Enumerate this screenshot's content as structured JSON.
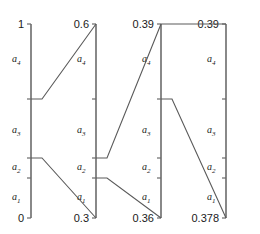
{
  "figure": {
    "type": "nomogram",
    "axis_count": 4,
    "region_labels": [
      "a_1",
      "a_2",
      "a_3",
      "a_4"
    ],
    "axes": [
      {
        "id": "axis-1",
        "x": 31,
        "top_label": "1",
        "bottom_label": "0",
        "top_label_anchor": "end",
        "bottom_label_anchor": "end",
        "top_y": 24,
        "bottom_y": 218,
        "ticks": [
          24,
          99,
          158,
          178,
          218
        ],
        "regions": [
          {
            "name": "a4",
            "glyph": "a",
            "sub": "4",
            "label_y": 62
          },
          {
            "name": "a3",
            "glyph": "a",
            "sub": "3",
            "label_y": 133
          },
          {
            "name": "a2",
            "glyph": "a",
            "sub": "2",
            "label_y": 170
          },
          {
            "name": "a1",
            "glyph": "a",
            "sub": "1",
            "label_y": 200
          }
        ]
      },
      {
        "id": "axis-2",
        "x": 96,
        "top_label": "0.6",
        "bottom_label": "0.3",
        "top_label_anchor": "end",
        "bottom_label_anchor": "end",
        "top_y": 24,
        "bottom_y": 218,
        "ticks": [
          24,
          99,
          158,
          178,
          218
        ],
        "regions": [
          {
            "name": "a4",
            "glyph": "a",
            "sub": "4",
            "label_y": 62
          },
          {
            "name": "a3",
            "glyph": "a",
            "sub": "3",
            "label_y": 133
          },
          {
            "name": "a2",
            "glyph": "a",
            "sub": "2",
            "label_y": 170
          },
          {
            "name": "a1",
            "glyph": "a",
            "sub": "1",
            "label_y": 200
          }
        ]
      },
      {
        "id": "axis-3",
        "x": 161,
        "top_label": "0.39",
        "bottom_label": "0.36",
        "top_label_anchor": "end",
        "bottom_label_anchor": "end",
        "top_y": 24,
        "bottom_y": 218,
        "ticks": [
          24,
          99,
          158,
          178,
          218
        ],
        "regions": [
          {
            "name": "a4",
            "glyph": "a",
            "sub": "4",
            "label_y": 62
          },
          {
            "name": "a3",
            "glyph": "a",
            "sub": "3",
            "label_y": 133
          },
          {
            "name": "a2",
            "glyph": "a",
            "sub": "2",
            "label_y": 170
          },
          {
            "name": "a1",
            "glyph": "a",
            "sub": "1",
            "label_y": 200
          }
        ]
      },
      {
        "id": "axis-4",
        "x": 226,
        "top_label": "0.39",
        "bottom_label": "0.378",
        "top_label_anchor": "end",
        "bottom_label_anchor": "end",
        "top_y": 24,
        "bottom_y": 218,
        "ticks": [
          24,
          99,
          158,
          178,
          218
        ],
        "regions": [
          {
            "name": "a4",
            "glyph": "a",
            "sub": "4",
            "label_y": 62
          },
          {
            "name": "a3",
            "glyph": "a",
            "sub": "3",
            "label_y": 133
          },
          {
            "name": "a2",
            "glyph": "a",
            "sub": "2",
            "label_y": 170
          },
          {
            "name": "a1",
            "glyph": "a",
            "sub": "1",
            "label_y": 200
          }
        ]
      }
    ],
    "connectors": [
      {
        "id": "conn-1",
        "from_axis": 1,
        "from_y": 99,
        "to_axis": 2,
        "to_y": 24,
        "stub": 11
      },
      {
        "id": "conn-2",
        "from_axis": 1,
        "from_y": 158,
        "to_axis": 2,
        "to_y": 218,
        "stub": 11
      },
      {
        "id": "conn-3",
        "from_axis": 2,
        "from_y": 158,
        "to_axis": 3,
        "to_y": 24,
        "stub": 11
      },
      {
        "id": "conn-4",
        "from_axis": 2,
        "from_y": 178,
        "to_axis": 3,
        "to_y": 218,
        "stub": 11
      },
      {
        "id": "conn-5",
        "from_axis": 3,
        "from_y": 24,
        "to_axis": 4,
        "to_y": 24,
        "stub": 0
      },
      {
        "id": "conn-6",
        "from_axis": 3,
        "from_y": 99,
        "to_axis": 4,
        "to_y": 218,
        "stub": 11
      }
    ],
    "colors": {
      "axis": "#6b6b6b",
      "connector": "#5a5a5a",
      "text": "#1a1a1a",
      "background": "#ffffff"
    }
  }
}
